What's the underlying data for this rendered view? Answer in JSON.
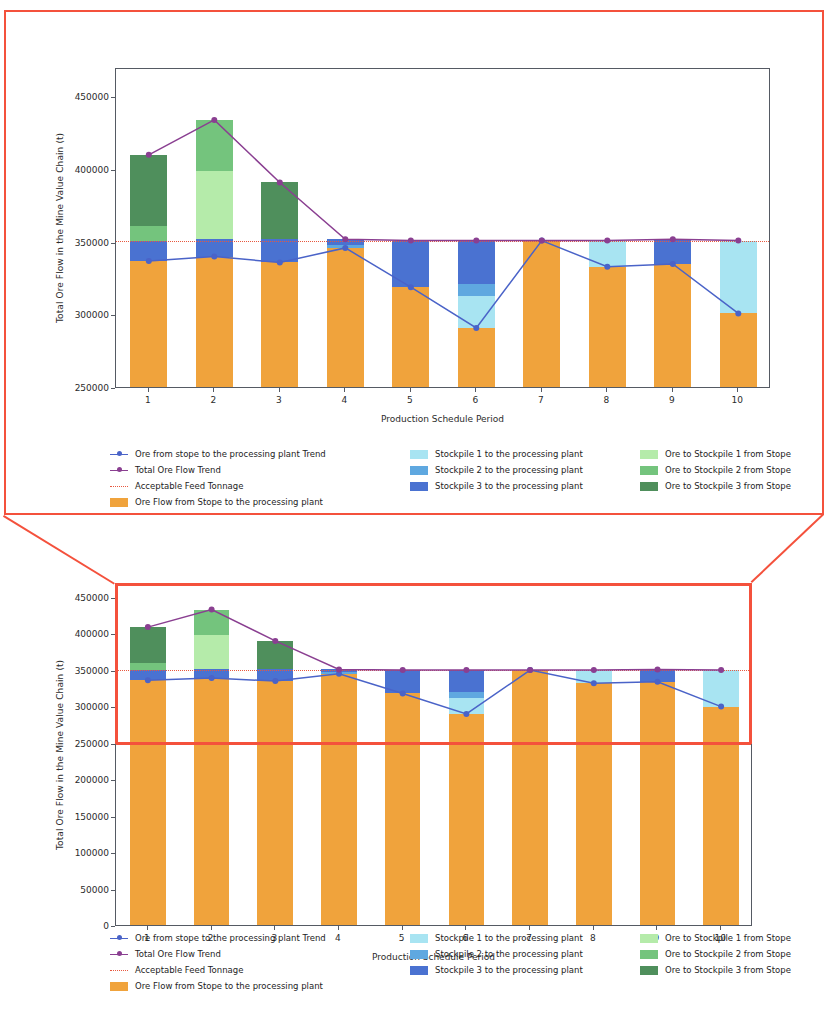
{
  "figure": {
    "annotation": {
      "type": "zoom-callout",
      "color": "#f4513c",
      "description": "Red zoom callout connecting the magnified upper chart to the highlighted region of the lower full-range chart"
    }
  },
  "colors": {
    "ore_flow_stope": "#f0a33c",
    "stockpile1_to_plant": "#a8e4f2",
    "stockpile2_to_plant": "#5fa8e0",
    "stockpile3_to_plant": "#4a72d1",
    "ore_to_stockpile1": "#b5ebaa",
    "ore_to_stockpile2": "#74c47d",
    "ore_to_stockpile3": "#4f8f5c",
    "stope_trend_line": "#4a63c8",
    "total_flow_trend_line": "#8a3f91",
    "acceptable_feed_line": "#e8583f",
    "axis": "#555a63",
    "callout": "#f4513c"
  },
  "legend": {
    "columns": [
      [
        {
          "label": "Ore from stope to the processing plant Trend",
          "style": "line-marker",
          "color": "#4a63c8"
        },
        {
          "label": "Total Ore Flow Trend",
          "style": "line-marker",
          "color": "#8a3f91"
        },
        {
          "label": "Acceptable Feed Tonnage",
          "style": "dotted-line",
          "color": "#e8583f"
        },
        {
          "label": "Ore Flow from Stope to the processing plant",
          "style": "patch",
          "color": "#f0a33c"
        }
      ],
      [
        {
          "label": "Stockpile 1 to the processing plant",
          "style": "patch",
          "color": "#a8e4f2"
        },
        {
          "label": "Stockpile 2 to the processing plant",
          "style": "patch",
          "color": "#5fa8e0"
        },
        {
          "label": "Stockpile 3 to the processing plant",
          "style": "patch",
          "color": "#4a72d1"
        }
      ],
      [
        {
          "label": "Ore to Stockpile 1 from Stope",
          "style": "patch",
          "color": "#b5ebaa"
        },
        {
          "label": "Ore to Stockpile 2 from Stope",
          "style": "patch",
          "color": "#74c47d"
        },
        {
          "label": "Ore to Stockpile 3 from Stope",
          "style": "patch",
          "color": "#4f8f5c"
        }
      ]
    ]
  },
  "chart_data": [
    {
      "id": "zoomed-detail",
      "type": "bar",
      "subtype": "stacked-bar-with-lines",
      "title": "",
      "xlabel": "Production Schedule Period",
      "ylabel": "Total Ore Flow in the Mine Value Chain (t)",
      "categories": [
        "1",
        "2",
        "3",
        "4",
        "5",
        "6",
        "7",
        "8",
        "9",
        "10"
      ],
      "ylim": [
        250000,
        470000
      ],
      "yticks": [
        250000,
        300000,
        350000,
        400000,
        450000
      ],
      "ytick_labels": [
        "250000",
        "300000",
        "350000",
        "400000",
        "450000"
      ],
      "grid": false,
      "legend_position": "below",
      "series": [
        {
          "name": "Ore Flow from Stope to the processing plant",
          "color": "#f0a33c",
          "kind": "bar",
          "values": [
            338000,
            341000,
            337000,
            347000,
            320000,
            292000,
            352000,
            334000,
            336000,
            302000
          ]
        },
        {
          "name": "Stockpile 1 to the processing plant",
          "color": "#a8e4f2",
          "kind": "bar",
          "values": [
            0,
            0,
            0,
            0,
            0,
            22000,
            0,
            18000,
            0,
            50000
          ]
        },
        {
          "name": "Stockpile 2 to the processing plant",
          "color": "#5fa8e0",
          "kind": "bar",
          "values": [
            0,
            0,
            0,
            2000,
            0,
            8000,
            0,
            0,
            0,
            0
          ]
        },
        {
          "name": "Stockpile 3 to the processing plant",
          "color": "#4a72d1",
          "kind": "bar",
          "values": [
            14000,
            12000,
            16000,
            4000,
            32000,
            30000,
            0,
            0,
            17000,
            0
          ]
        },
        {
          "name": "Ore to Stockpile 1 from Stope",
          "color": "#b5ebaa",
          "kind": "bar",
          "values": [
            0,
            47000,
            0,
            0,
            0,
            0,
            0,
            0,
            0,
            0
          ]
        },
        {
          "name": "Ore to Stockpile 2 from Stope",
          "color": "#74c47d",
          "kind": "bar",
          "values": [
            10000,
            35000,
            0,
            0,
            0,
            0,
            0,
            0,
            0,
            0
          ]
        },
        {
          "name": "Ore to Stockpile 3 from Stope",
          "color": "#4f8f5c",
          "kind": "bar",
          "values": [
            49000,
            0,
            39000,
            0,
            0,
            0,
            0,
            0,
            0,
            0
          ]
        },
        {
          "name": "Ore from stope to the processing plant Trend",
          "color": "#4a63c8",
          "kind": "line",
          "values": [
            338000,
            341000,
            337000,
            347000,
            320000,
            292000,
            352000,
            334000,
            336000,
            302000
          ]
        },
        {
          "name": "Total Ore Flow Trend",
          "color": "#8a3f91",
          "kind": "line",
          "values": [
            411000,
            435000,
            392000,
            353000,
            352000,
            352000,
            352000,
            352000,
            353000,
            352000
          ]
        },
        {
          "name": "Acceptable Feed Tonnage",
          "color": "#e8583f",
          "kind": "hline",
          "value": 352000
        }
      ]
    },
    {
      "id": "full-range",
      "type": "bar",
      "subtype": "stacked-bar-with-lines",
      "title": "",
      "xlabel": "Production Schedule Period",
      "ylabel": "Total Ore Flow in the Mine Value Chain (t)",
      "categories": [
        "1",
        "2",
        "3",
        "4",
        "5",
        "6",
        "7",
        "8",
        "9",
        "10"
      ],
      "ylim": [
        0,
        470000
      ],
      "yticks": [
        0,
        50000,
        100000,
        150000,
        200000,
        250000,
        300000,
        350000,
        400000,
        450000
      ],
      "ytick_labels": [
        "0",
        "50000",
        "100000",
        "150000",
        "200000",
        "250000",
        "300000",
        "350000",
        "400000",
        "450000"
      ],
      "grid": false,
      "legend_position": "below",
      "highlight_region": {
        "ymin": 250000,
        "ymax": 470000,
        "color": "#f4513c"
      },
      "series": [
        {
          "name": "Ore Flow from Stope to the processing plant",
          "color": "#f0a33c",
          "kind": "bar",
          "values": [
            338000,
            341000,
            337000,
            347000,
            320000,
            292000,
            352000,
            334000,
            336000,
            302000
          ]
        },
        {
          "name": "Stockpile 1 to the processing plant",
          "color": "#a8e4f2",
          "kind": "bar",
          "values": [
            0,
            0,
            0,
            0,
            0,
            22000,
            0,
            18000,
            0,
            50000
          ]
        },
        {
          "name": "Stockpile 2 to the processing plant",
          "color": "#5fa8e0",
          "kind": "bar",
          "values": [
            0,
            0,
            0,
            2000,
            0,
            8000,
            0,
            0,
            0,
            0
          ]
        },
        {
          "name": "Stockpile 3 to the processing plant",
          "color": "#4a72d1",
          "kind": "bar",
          "values": [
            14000,
            12000,
            16000,
            4000,
            32000,
            30000,
            0,
            0,
            17000,
            0
          ]
        },
        {
          "name": "Ore to Stockpile 1 from Stope",
          "color": "#b5ebaa",
          "kind": "bar",
          "values": [
            0,
            47000,
            0,
            0,
            0,
            0,
            0,
            0,
            0,
            0
          ]
        },
        {
          "name": "Ore to Stockpile 2 from Stope",
          "color": "#74c47d",
          "kind": "bar",
          "values": [
            10000,
            35000,
            0,
            0,
            0,
            0,
            0,
            0,
            0,
            0
          ]
        },
        {
          "name": "Ore to Stockpile 3 from Stope",
          "color": "#4f8f5c",
          "kind": "bar",
          "values": [
            49000,
            0,
            39000,
            0,
            0,
            0,
            0,
            0,
            0,
            0
          ]
        },
        {
          "name": "Ore from stope to the processing plant Trend",
          "color": "#4a63c8",
          "kind": "line",
          "values": [
            338000,
            341000,
            337000,
            347000,
            320000,
            292000,
            352000,
            334000,
            336000,
            302000
          ]
        },
        {
          "name": "Total Ore Flow Trend",
          "color": "#8a3f91",
          "kind": "line",
          "values": [
            411000,
            435000,
            392000,
            353000,
            352000,
            352000,
            352000,
            352000,
            353000,
            352000
          ]
        },
        {
          "name": "Acceptable Feed Tonnage",
          "color": "#e8583f",
          "kind": "hline",
          "value": 352000
        }
      ]
    }
  ]
}
